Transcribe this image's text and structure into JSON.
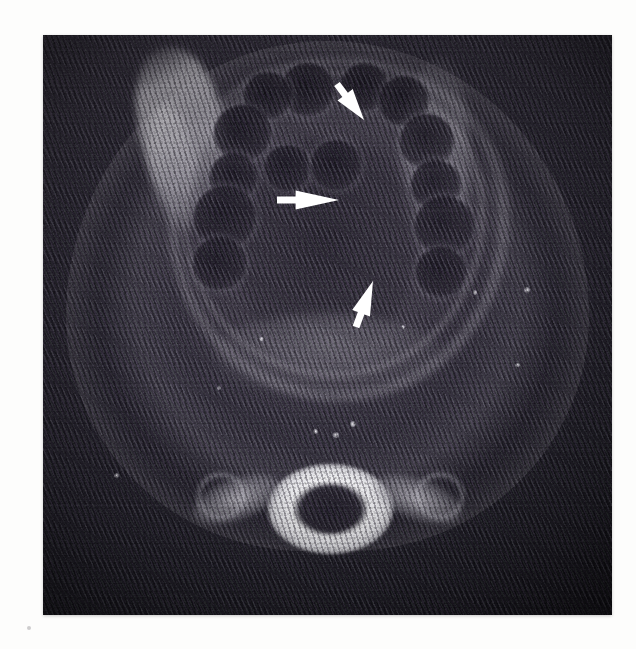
{
  "figure": {
    "kind": "medical-scan",
    "modality": "axial CT",
    "region": "head and neck / oral cavity at the level of the mandible",
    "caption": "",
    "frame": {
      "left": 43,
      "top": 35,
      "width": 569,
      "height": 580
    },
    "page_background": "#fdfdfc"
  },
  "colors": {
    "annotation": "#ffffff",
    "bone_bright": "#f6f6f8",
    "soft_tissue": "#5c5664",
    "background_dark": "#211f28",
    "cavity_dark": "#241f2c"
  },
  "annotations": [
    {
      "id": "arrow-1",
      "name": "arrow-superior-right",
      "shape": "solid-arrow",
      "color": "#ffffff",
      "direction": "down-right",
      "angle_deg": 52,
      "tail": {
        "x": 337,
        "y": 84
      },
      "tip": {
        "x": 364,
        "y": 120
      },
      "length_px": 45,
      "points_at": "lesion margin, right paramedian oral cavity"
    },
    {
      "id": "arrow-2",
      "name": "arrow-midline-lateral",
      "shape": "solid-arrow",
      "color": "#ffffff",
      "direction": "right",
      "angle_deg": 0,
      "tail": {
        "x": 277,
        "y": 200
      },
      "tip": {
        "x": 339,
        "y": 200
      },
      "length_px": 62,
      "points_at": "lesion centre within the floor of mouth"
    },
    {
      "id": "arrow-3",
      "name": "arrow-inferior-posterior",
      "shape": "solid-arrow",
      "color": "#ffffff",
      "direction": "up-right",
      "angle_deg": -68,
      "tail": {
        "x": 356,
        "y": 327
      },
      "tip": {
        "x": 373,
        "y": 281
      },
      "length_px": 49,
      "points_at": "posterior lesion border"
    }
  ],
  "structures": {
    "teeth": [
      {
        "name": "tooth-left-1",
        "cx": 46.5,
        "cy": 9.5,
        "r": 4.6
      },
      {
        "name": "tooth-left-2",
        "cx": 39.5,
        "cy": 10.5,
        "r": 4.2
      },
      {
        "name": "tooth-left-3",
        "cx": 35.0,
        "cy": 17.0,
        "r": 5.0
      },
      {
        "name": "tooth-left-4",
        "cx": 33.5,
        "cy": 24.5,
        "r": 4.2
      },
      {
        "name": "tooth-left-5",
        "cx": 32.0,
        "cy": 31.5,
        "r": 5.4
      },
      {
        "name": "tooth-left-6",
        "cx": 31.0,
        "cy": 39.5,
        "r": 4.6
      },
      {
        "name": "tooth-right-1",
        "cx": 56.5,
        "cy": 9.0,
        "r": 4.2
      },
      {
        "name": "tooth-right-2",
        "cx": 63.5,
        "cy": 11.5,
        "r": 4.4
      },
      {
        "name": "tooth-right-3",
        "cx": 67.5,
        "cy": 18.5,
        "r": 4.8
      },
      {
        "name": "tooth-right-4",
        "cx": 69.0,
        "cy": 26.0,
        "r": 4.4
      },
      {
        "name": "tooth-right-5",
        "cx": 70.5,
        "cy": 33.0,
        "r": 5.2
      },
      {
        "name": "tooth-right-6",
        "cx": 70.0,
        "cy": 41.0,
        "r": 4.4
      },
      {
        "name": "tooth-mid-left",
        "cx": 43.0,
        "cy": 23.0,
        "r": 4.0
      },
      {
        "name": "tooth-mid",
        "cx": 51.5,
        "cy": 22.5,
        "r": 4.4
      }
    ],
    "specks": [
      {
        "name": "speck-a",
        "cx": 54.0,
        "cy": 66.5,
        "d": 1.5
      },
      {
        "name": "speck-b",
        "cx": 51.0,
        "cy": 68.5,
        "d": 1.4
      },
      {
        "name": "speck-c",
        "cx": 47.5,
        "cy": 68.0,
        "d": 1.2
      },
      {
        "name": "speck-d",
        "cx": 84.5,
        "cy": 43.5,
        "d": 1.5
      },
      {
        "name": "speck-e",
        "cx": 83.0,
        "cy": 56.5,
        "d": 1.2
      },
      {
        "name": "speck-f",
        "cx": 75.5,
        "cy": 44.0,
        "d": 1.1
      },
      {
        "name": "speck-g",
        "cx": 12.5,
        "cy": 75.5,
        "d": 1.3
      },
      {
        "name": "speck-h",
        "cx": 30.5,
        "cy": 60.5,
        "d": 1.1
      },
      {
        "name": "speck-i",
        "cx": 38.0,
        "cy": 52.0,
        "d": 1.2
      },
      {
        "name": "speck-j",
        "cx": 63.0,
        "cy": 50.0,
        "d": 1.0
      }
    ]
  }
}
